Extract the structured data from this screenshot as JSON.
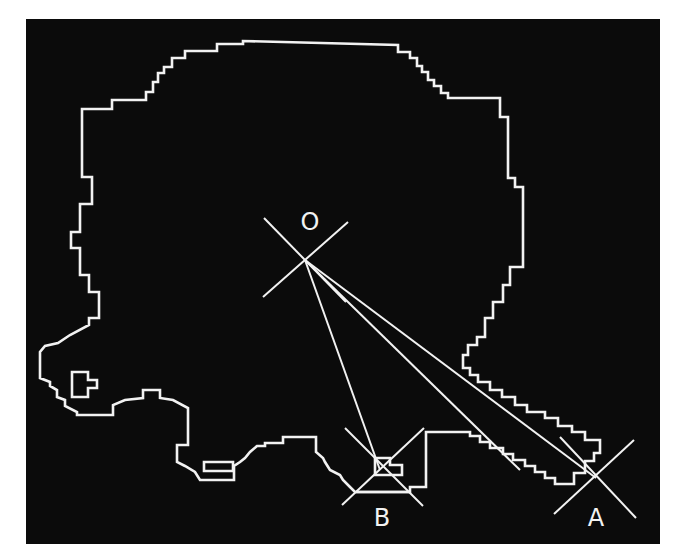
{
  "figure": {
    "background_color": "#0b0b0b",
    "line_color": "#f2f2f2"
  },
  "points": {
    "O": {
      "label": "O",
      "x": 305,
      "y": 260
    },
    "A": {
      "label": "A",
      "x": 596,
      "y": 478
    },
    "B": {
      "label": "B",
      "x": 383,
      "y": 468
    }
  },
  "labels": {
    "O": "O",
    "A": "A",
    "B": "B"
  }
}
